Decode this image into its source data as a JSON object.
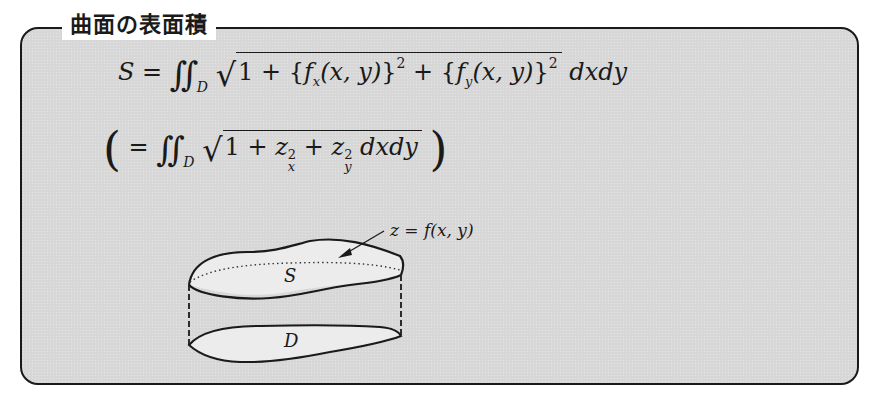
{
  "box": {
    "title": "曲面の表面積",
    "background_color": "#d7d7d7",
    "border_color": "#1a1a1a"
  },
  "formula_main": {
    "lhs": "S",
    "eq": "=",
    "integral": "∬",
    "domain": "D",
    "radicand_1": "1 + {",
    "fx": "f",
    "fx_sub": "x",
    "args_1": "(x, y)",
    "close_1": "}",
    "pow_1": "2",
    "plus": " + {",
    "fy": "f",
    "fy_sub": "y",
    "args_2": "(x, y)",
    "close_2": "}",
    "pow_2": "2",
    "diff": "dxdy"
  },
  "formula_alt": {
    "open": "(",
    "eq": "=",
    "integral": "∬",
    "domain": "D",
    "one_plus": "1 + ",
    "z1": "z",
    "z1_sup": "2",
    "z1_sub": "x",
    "plus": " + ",
    "z2": "z",
    "z2_sup": "2",
    "z2_sub": "y",
    "diff": "dxdy",
    "close": ")"
  },
  "figure": {
    "surface_label": "z = f(x, y)",
    "top_region_label": "S",
    "bottom_region_label": "D"
  }
}
